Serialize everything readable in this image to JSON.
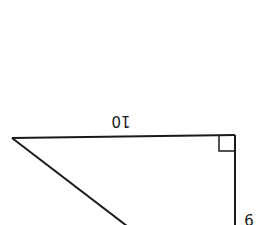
{
  "diagram": {
    "type": "right-triangle",
    "orientation": "rotated 180 degrees",
    "stroke_color": "#1a1a1a",
    "background": "#ffffff",
    "labels": {
      "top_side": "10",
      "right_side": "9"
    },
    "right_angle_marker": true
  }
}
